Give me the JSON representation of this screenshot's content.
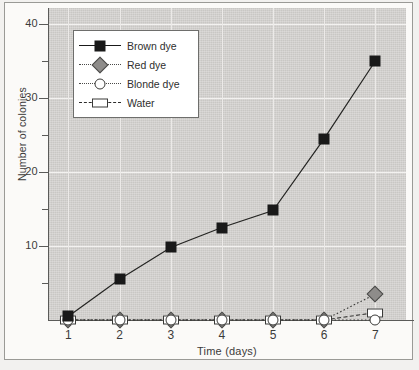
{
  "chart_data": {
    "type": "line",
    "title": "",
    "xlabel": "Time (days)",
    "ylabel": "Number of colonies",
    "x": [
      1,
      2,
      3,
      4,
      5,
      6,
      7
    ],
    "xtick_labels": [
      "1",
      "2",
      "3",
      "4",
      "5",
      "6",
      "7"
    ],
    "ytick_labels": [
      "10",
      "20",
      "30",
      "40"
    ],
    "ytick_values": [
      10,
      20,
      30,
      40
    ],
    "yminor_values": [
      5,
      15,
      25,
      35
    ],
    "xlim": [
      0.6,
      7.6
    ],
    "ylim": [
      0,
      41
    ],
    "grid": true,
    "legend_position": "upper-left-inside",
    "plot_background": "#c9c7c4",
    "gridline_color": "#f3f2f0",
    "series": [
      {
        "name": "Brown dye",
        "marker": "filled-square",
        "color": "#191919",
        "line_style": "solid",
        "values": [
          0.5,
          5.5,
          9.8,
          12.5,
          14.8,
          24.5,
          35.0
        ]
      },
      {
        "name": "Red dye",
        "marker": "gray-diamond",
        "color": "#8e8c8a",
        "line_style": "dotted",
        "values": [
          0,
          0,
          0,
          0,
          0,
          0,
          3.5
        ]
      },
      {
        "name": "Blonde dye",
        "marker": "open-circle",
        "color": "#ffffff",
        "line_style": "dotted",
        "values": [
          0,
          0,
          0,
          0,
          0,
          0,
          0
        ]
      },
      {
        "name": "Water",
        "marker": "open-rectangle",
        "color": "#ffffff",
        "line_style": "dashed",
        "values": [
          0,
          0,
          0,
          0,
          0,
          0,
          1.0
        ]
      }
    ]
  },
  "legend": {
    "entries": [
      {
        "label": "Brown dye"
      },
      {
        "label": "Red dye"
      },
      {
        "label": "Blonde dye"
      },
      {
        "label": "Water"
      }
    ]
  },
  "axes": {
    "y_title": "Number of colonies",
    "x_title": "Time (days)"
  }
}
